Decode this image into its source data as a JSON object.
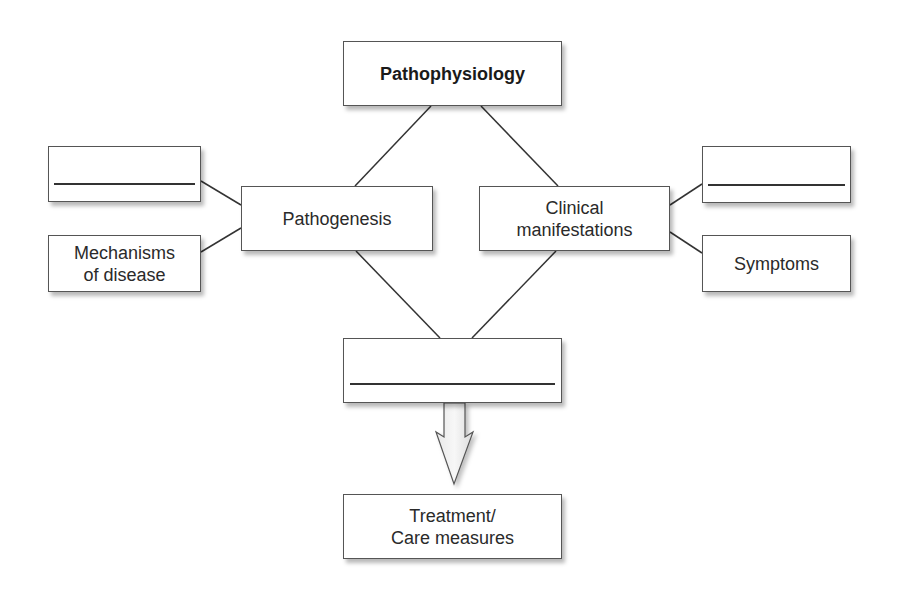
{
  "diagram": {
    "title": "Pathophysiology",
    "nodes": {
      "pathophysiology": "Pathophysiology",
      "pathogenesis": "Pathogenesis",
      "clinical_line1": "Clinical",
      "clinical_line2": "manifestations",
      "left_blank": "",
      "mechanisms_line1": "Mechanisms",
      "mechanisms_line2": "of disease",
      "right_blank": "",
      "symptoms": "Symptoms",
      "center_blank": "",
      "treatment_line1": "Treatment/",
      "treatment_line2": "Care measures"
    },
    "edges": [
      [
        "pathophysiology",
        "pathogenesis"
      ],
      [
        "pathophysiology",
        "clinical_manifestations"
      ],
      [
        "left_blank",
        "pathogenesis"
      ],
      [
        "mechanisms_of_disease",
        "pathogenesis"
      ],
      [
        "clinical_manifestations",
        "right_blank"
      ],
      [
        "clinical_manifestations",
        "symptoms"
      ],
      [
        "pathogenesis",
        "center_blank"
      ],
      [
        "clinical_manifestations",
        "center_blank"
      ],
      [
        "center_blank",
        "treatment_care_measures",
        "arrow"
      ]
    ]
  }
}
